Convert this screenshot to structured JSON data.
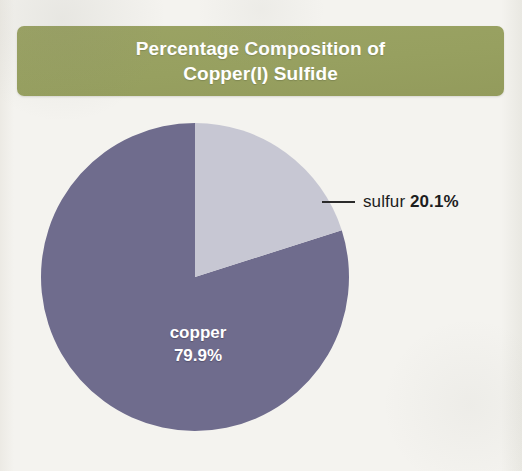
{
  "figure": {
    "title_lines": [
      "Percentage Composition of",
      "Copper(I) Sulfide"
    ],
    "banner_color": "#97a060",
    "background_color": "#f3f2ee"
  },
  "labels": {
    "copper": {
      "name": "copper",
      "value": "79.9%"
    },
    "sulfur": {
      "name": "sulfur",
      "value": "20.1%"
    }
  },
  "chart_data": {
    "type": "pie",
    "title": "Percentage Composition of Copper(I) Sulfide",
    "subtitle": "",
    "xlabel": "",
    "ylabel": "",
    "categories": [
      "copper",
      "sulfur"
    ],
    "values": [
      79.9,
      20.1
    ],
    "units": "percent",
    "value_labels": [
      "79.9%",
      "20.1%"
    ],
    "colors": [
      "#6f6c8d",
      "#c7c7d3"
    ],
    "start_angle_deg": 0,
    "direction": "clockwise",
    "legend": "none",
    "grid": false,
    "annotations": [
      {
        "text": "copper 79.9%",
        "placement": "inside-slice",
        "slice": "copper"
      },
      {
        "text": "sulfur 20.1%",
        "placement": "outside-with-leader-line",
        "slice": "sulfur"
      }
    ]
  }
}
